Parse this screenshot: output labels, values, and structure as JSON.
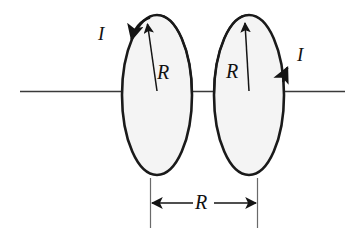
{
  "figure": {
    "kind": "physics-diagram",
    "width": 359,
    "height": 236,
    "background_color": "#ffffff",
    "stroke_color": "#1a1a1a",
    "loop_fill_color": "#f4f4f4",
    "axis_color": "#3a3a3a"
  },
  "labels": {
    "current_left": "I",
    "current_right": "I",
    "radius_left": "R",
    "radius_right": "R",
    "separation": "R"
  },
  "geometry": {
    "axis": {
      "x1": 20,
      "y1": 91,
      "x2": 345,
      "y2": 91
    },
    "left_loop": {
      "cx": 157,
      "cy": 95,
      "rx": 35,
      "ry": 80
    },
    "right_loop": {
      "cx": 249,
      "cy": 95,
      "rx": 35,
      "ry": 80
    },
    "left_radius_arrow": {
      "x1": 157,
      "y1": 91,
      "x2": 147,
      "y2": 22
    },
    "right_radius_arrow": {
      "x1": 249,
      "y1": 91,
      "x2": 245,
      "y2": 21
    },
    "left_current_arrow_at": {
      "x": 131,
      "y": 48,
      "direction": "down-left"
    },
    "right_current_arrow_at": {
      "x": 287,
      "y": 62,
      "direction": "up"
    },
    "dimension_line": {
      "x1": 150,
      "x2": 257,
      "y": 203
    },
    "extension_left": {
      "x": 150,
      "y1": 178,
      "y2": 228
    },
    "extension_right": {
      "x": 257,
      "y1": 178,
      "y2": 228
    }
  },
  "label_positions": {
    "current_left": {
      "x": 98,
      "y": 24
    },
    "current_right": {
      "x": 297,
      "y": 45
    },
    "radius_left": {
      "x": 157,
      "y": 62
    },
    "radius_right": {
      "x": 226,
      "y": 61
    },
    "separation": {
      "x": 195,
      "y": 192
    }
  }
}
